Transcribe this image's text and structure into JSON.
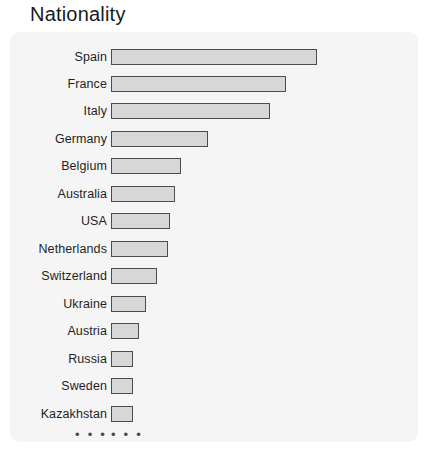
{
  "title": "Nationality",
  "panel": {
    "background_color": "#f5f5f5",
    "corner_radius": "9px"
  },
  "style": {
    "bar_fill_color": "#d7d7d7",
    "bar_border_color": "#4c4c4c",
    "label_color": "#1f1f1f",
    "title_color": "#1a1a1a"
  },
  "truncation": {
    "label_dots": "• • •",
    "bar_dots": "• • •"
  },
  "chart_data": {
    "type": "bar",
    "orientation": "horizontal",
    "title": "Nationality",
    "xlabel": "",
    "ylabel": "",
    "grid": false,
    "legend": false,
    "axis_ticks_visible": false,
    "truncated": true,
    "categories": [
      "Spain",
      "France",
      "Italy",
      "Germany",
      "Belgium",
      "Australia",
      "USA",
      "Netherlands",
      "Switzerland",
      "Ukraine",
      "Austria",
      "Russia",
      "Sweden",
      "Kazakhstan"
    ],
    "values": [
      206,
      175,
      159,
      97,
      70,
      64,
      59,
      57,
      46,
      35,
      28,
      22,
      22,
      22
    ],
    "xlim": [
      0,
      210
    ],
    "bars": [
      {
        "label": "Spain",
        "value": 206,
        "width_px": 206,
        "top_px": 46
      },
      {
        "label": "France",
        "value": 175,
        "width_px": 175,
        "top_px": 73
      },
      {
        "label": "Italy",
        "value": 159,
        "width_px": 159,
        "top_px": 100
      },
      {
        "label": "Germany",
        "value": 97,
        "width_px": 97,
        "top_px": 128
      },
      {
        "label": "Belgium",
        "value": 70,
        "width_px": 70,
        "top_px": 155
      },
      {
        "label": "Australia",
        "value": 64,
        "width_px": 64,
        "top_px": 183
      },
      {
        "label": "USA",
        "value": 59,
        "width_px": 59,
        "top_px": 210
      },
      {
        "label": "Netherlands",
        "value": 57,
        "width_px": 57,
        "top_px": 238
      },
      {
        "label": "Switzerland",
        "value": 46,
        "width_px": 46,
        "top_px": 265
      },
      {
        "label": "Ukraine",
        "value": 35,
        "width_px": 35,
        "top_px": 293
      },
      {
        "label": "Austria",
        "value": 28,
        "width_px": 28,
        "top_px": 320
      },
      {
        "label": "Russia",
        "value": 22,
        "width_px": 22,
        "top_px": 348
      },
      {
        "label": "Sweden",
        "value": 22,
        "width_px": 22,
        "top_px": 375
      },
      {
        "label": "Kazakhstan",
        "value": 22,
        "width_px": 22,
        "top_px": 403
      }
    ],
    "ellipsis_row_top_px": 424
  }
}
